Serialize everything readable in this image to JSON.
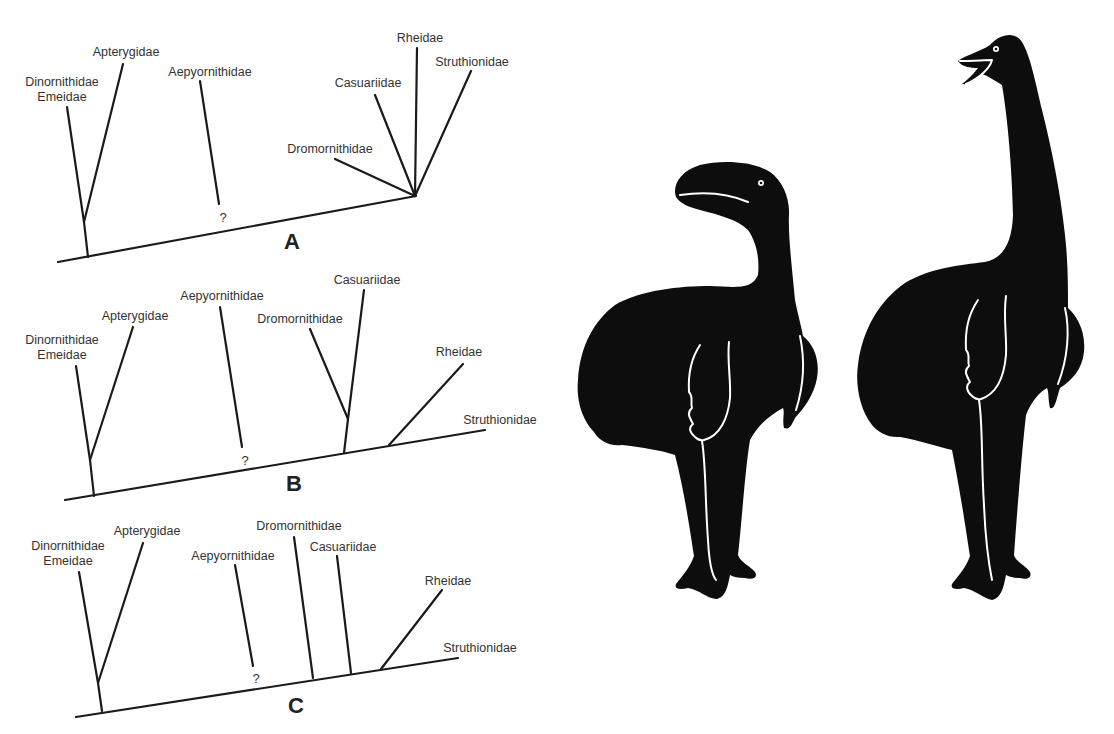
{
  "figure": {
    "trees": [
      {
        "panel_label": "A",
        "taxa": {
          "dinornithidae": "Dinornithidae",
          "emeidae": "Emeidae",
          "apterygidae": "Apterygidae",
          "aepyornithidae": "Aepyornithidae",
          "uncertain_marker": "?",
          "dromornithidae": "Dromornithidae",
          "casuariidae": "Casuariidae",
          "rheidae": "Rheidae",
          "struthionidae": "Struthionidae"
        }
      },
      {
        "panel_label": "B",
        "taxa": {
          "dinornithidae": "Dinornithidae",
          "emeidae": "Emeidae",
          "apterygidae": "Apterygidae",
          "aepyornithidae": "Aepyornithidae",
          "uncertain_marker": "?",
          "dromornithidae": "Dromornithidae",
          "casuariidae": "Casuariidae",
          "rheidae": "Rheidae",
          "struthionidae": "Struthionidae"
        }
      },
      {
        "panel_label": "C",
        "taxa": {
          "dinornithidae": "Dinornithidae",
          "emeidae": "Emeidae",
          "apterygidae": "Apterygidae",
          "aepyornithidae": "Aepyornithidae",
          "uncertain_marker": "?",
          "dromornithidae": "Dromornithidae",
          "casuariidae": "Casuariidae",
          "rheidae": "Rheidae",
          "struthionidae": "Struthionidae"
        }
      }
    ],
    "silhouettes": [
      {
        "name": "bird-silhouette-head-lowered",
        "color": "#0d0d0d"
      },
      {
        "name": "bird-silhouette-head-raised",
        "color": "#0d0d0d"
      }
    ],
    "colors": {
      "background": "#ffffff",
      "line": "#1a1a1a",
      "text": "#333333",
      "silhouette": "#0d0d0d"
    }
  }
}
